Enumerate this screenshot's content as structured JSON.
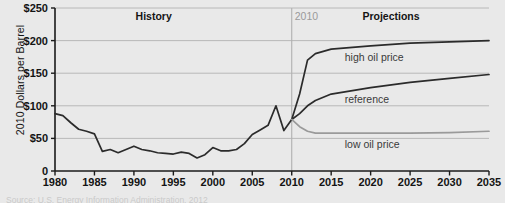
{
  "chart_data": {
    "type": "line",
    "title": "",
    "xlabel": "",
    "ylabel": "2010 Dollars per Barrel",
    "xlim": [
      1980,
      2035
    ],
    "ylim": [
      0,
      250
    ],
    "grid": true,
    "legend_position": "inline-annotations",
    "ytick_labels": [
      "$250",
      "$200",
      "$150",
      "$100",
      "$50",
      "0"
    ],
    "ytick_values": [
      250,
      200,
      150,
      100,
      50,
      0
    ],
    "xtick_labels": [
      "1980",
      "1985",
      "1990",
      "1995",
      "2000",
      "2005",
      "2010",
      "2015",
      "2020",
      "2025",
      "2030",
      "2035"
    ],
    "xtick_values": [
      1980,
      1985,
      1990,
      1995,
      2000,
      2005,
      2010,
      2015,
      2020,
      2025,
      2030,
      2035
    ],
    "annotations": {
      "history": "History",
      "projections": "Projections",
      "divider_year": "2010",
      "divider_value": 2010
    },
    "series": [
      {
        "name": "history",
        "label": "",
        "color": "#2b2b2b",
        "x": [
          1980,
          1981,
          1982,
          1983,
          1984,
          1985,
          1986,
          1987,
          1988,
          1989,
          1990,
          1991,
          1992,
          1993,
          1994,
          1995,
          1996,
          1997,
          1998,
          1999,
          2000,
          2001,
          2002,
          2003,
          2004,
          2005,
          2006,
          2007,
          2008,
          2009,
          2010
        ],
        "values": [
          88,
          85,
          74,
          64,
          61,
          57,
          30,
          33,
          28,
          33,
          38,
          33,
          31,
          28,
          27,
          26,
          29,
          27,
          20,
          25,
          36,
          31,
          31,
          33,
          42,
          56,
          63,
          70,
          100,
          62,
          79
        ]
      },
      {
        "name": "high_oil_price",
        "label": "high oil price",
        "color": "#2b2b2b",
        "x": [
          2010,
          2011,
          2012,
          2013,
          2015,
          2020,
          2025,
          2030,
          2035
        ],
        "values": [
          79,
          118,
          170,
          180,
          187,
          192,
          196,
          198,
          200
        ]
      },
      {
        "name": "reference",
        "label": "reference",
        "color": "#2b2b2b",
        "x": [
          2010,
          2011,
          2012,
          2013,
          2015,
          2020,
          2025,
          2030,
          2035
        ],
        "values": [
          79,
          88,
          100,
          108,
          118,
          128,
          136,
          142,
          148
        ]
      },
      {
        "name": "low_oil_price",
        "label": "low oil price",
        "color": "#9a9a9a",
        "x": [
          2010,
          2011,
          2012,
          2013,
          2015,
          2020,
          2025,
          2030,
          2035
        ],
        "values": [
          79,
          68,
          61,
          58,
          58,
          58,
          58,
          59,
          61
        ]
      }
    ]
  },
  "source": {
    "text": "Source:  U.S. Energy Information Administration, 2012"
  }
}
